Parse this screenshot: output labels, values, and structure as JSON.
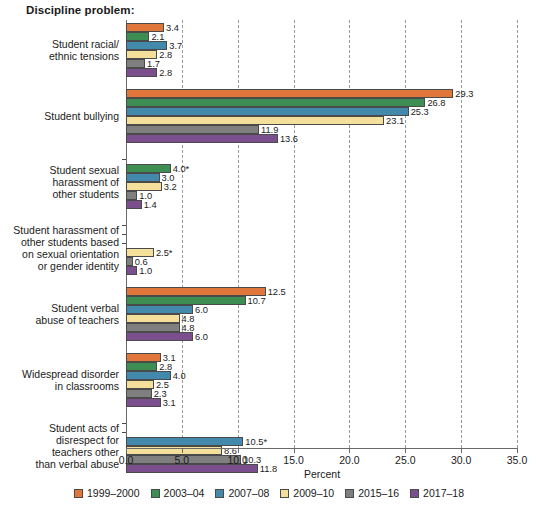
{
  "chart_data": {
    "type": "bar",
    "orientation": "horizontal",
    "title": "Discipline problem:",
    "xlabel": "Percent",
    "ylabel": "",
    "xlim": [
      0.0,
      35.0
    ],
    "xticks": [
      "0.0",
      "5.0",
      "10.0",
      "15.0",
      "20.0",
      "25.0",
      "30.0",
      "35.0"
    ],
    "grid": "vertical-dashed",
    "legend_position": "bottom",
    "footnote_marker": "*",
    "categories": [
      "Student racial/\nethnic tensions",
      "Student bullying",
      "Student sexual\nharassment of\nother students",
      "Student harassment of\nother students based\non sexual orientation\nor gender identity",
      "Student verbal\nabuse of teachers",
      "Widespread disorder\nin classrooms",
      "Student acts of\ndisrespect for\nteachers other\nthan verbal abuse"
    ],
    "series": [
      {
        "name": "1999–2000",
        "color": "#E0763A",
        "values": [
          3.4,
          29.3,
          null,
          null,
          12.5,
          3.1,
          null
        ],
        "labels": [
          "3.4",
          "29.3",
          "",
          "",
          "12.5",
          "3.1",
          ""
        ]
      },
      {
        "name": "2003–04",
        "color": "#3D8E52",
        "values": [
          2.1,
          26.8,
          4.0,
          null,
          10.7,
          2.8,
          null
        ],
        "labels": [
          "2.1",
          "26.8",
          "4.0*",
          "",
          "10.7",
          "2.8",
          ""
        ]
      },
      {
        "name": "2007–08",
        "color": "#4389AC",
        "values": [
          3.7,
          25.3,
          3.0,
          null,
          6.0,
          4.0,
          10.5
        ],
        "labels": [
          "3.7",
          "25.3",
          "3.0",
          "",
          "6.0",
          "4.0",
          "10.5*"
        ]
      },
      {
        "name": "2009–10",
        "color": "#F4DF9B",
        "values": [
          2.8,
          23.1,
          3.2,
          2.5,
          4.8,
          2.5,
          8.6
        ],
        "labels": [
          "2.8",
          "23.1",
          "3.2",
          "2.5*",
          "4.8",
          "2.5",
          "8.6"
        ]
      },
      {
        "name": "2015–16",
        "color": "#7F7F7F",
        "values": [
          1.7,
          11.9,
          1.0,
          0.6,
          4.8,
          2.3,
          10.3
        ],
        "labels": [
          "1.7",
          "11.9",
          "1.0",
          "0.6",
          "4.8",
          "2.3",
          "10.3"
        ]
      },
      {
        "name": "2017–18",
        "color": "#7B4F8E",
        "values": [
          2.8,
          13.6,
          1.4,
          1.0,
          6.0,
          3.1,
          11.8
        ],
        "labels": [
          "2.8",
          "13.6",
          "1.4",
          "1.0",
          "6.0",
          "3.1",
          "11.8"
        ]
      }
    ]
  }
}
